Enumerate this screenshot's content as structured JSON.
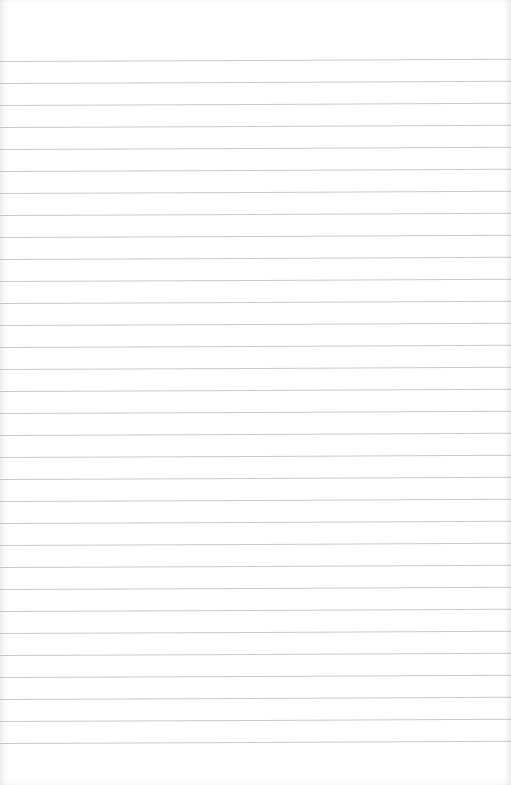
{
  "paper": {
    "type": "lined-paper",
    "background_color": "#ffffff",
    "line_color": "#c9c9c9",
    "line_count": 32,
    "first_line_y": 61,
    "line_spacing": 22
  }
}
